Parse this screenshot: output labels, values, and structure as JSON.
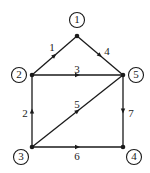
{
  "diagram": {
    "type": "directed-graph",
    "nodes": [
      {
        "id": "1",
        "label": "1",
        "x": 77,
        "y": 36,
        "lx": 77,
        "ly": 20
      },
      {
        "id": "2",
        "label": "2",
        "x": 32,
        "y": 75,
        "lx": 19,
        "ly": 75
      },
      {
        "id": "3",
        "label": "3",
        "x": 32,
        "y": 147,
        "lx": 21,
        "ly": 157
      },
      {
        "id": "4",
        "label": "4",
        "x": 123,
        "y": 147,
        "lx": 134,
        "ly": 157
      },
      {
        "id": "5",
        "label": "5",
        "x": 123,
        "y": 75,
        "lx": 136,
        "ly": 75
      }
    ],
    "edges": [
      {
        "id": "e1",
        "label": "1",
        "from": "2",
        "to": "1",
        "lx": 52,
        "ly": 48
      },
      {
        "id": "e2",
        "label": "2",
        "from": "3",
        "to": "2",
        "lx": 25,
        "ly": 114
      },
      {
        "id": "e3",
        "label": "3",
        "from": "2",
        "to": "5",
        "lx": 77,
        "ly": 70
      },
      {
        "id": "e4",
        "label": "4",
        "from": "1",
        "to": "5",
        "lx": 107,
        "ly": 52
      },
      {
        "id": "e5",
        "label": "5",
        "from": "3",
        "to": "5",
        "lx": 77,
        "ly": 105
      },
      {
        "id": "e6",
        "label": "6",
        "from": "3",
        "to": "4",
        "lx": 77,
        "ly": 157
      },
      {
        "id": "e7",
        "label": "7",
        "from": "5",
        "to": "4",
        "lx": 131,
        "ly": 114
      }
    ]
  }
}
